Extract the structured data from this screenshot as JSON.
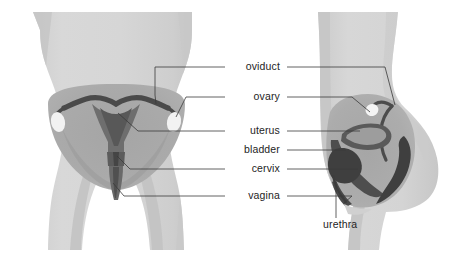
{
  "diagram": {
    "views": [
      {
        "id": "frontal",
        "name": "frontal view",
        "side": "left"
      },
      {
        "id": "sagittal",
        "name": "sagittal side view",
        "side": "right"
      }
    ],
    "background_color": "#ffffff"
  },
  "palette": {
    "body": "#d4d4d4",
    "body_edge": "#c4c4c4",
    "body_shadow": "#c8c8c8",
    "pelvis": "#a9a9a9",
    "pelvis_deep": "#9a9a9a",
    "organ_dark": "#4b4b4b",
    "organ_mid": "#6f6f6f",
    "ovary_white": "#f3f3f3",
    "leader_line": "#3a3a3a",
    "label_text": "#242424"
  },
  "labels": [
    {
      "id": "oviduct",
      "text": "oviduct",
      "x": 280,
      "y": 70,
      "align": "end"
    },
    {
      "id": "ovary",
      "text": "ovary",
      "x": 280,
      "y": 100,
      "align": "end"
    },
    {
      "id": "uterus",
      "text": "uterus",
      "x": 280,
      "y": 134,
      "align": "end"
    },
    {
      "id": "bladder",
      "text": "bladder",
      "x": 280,
      "y": 153,
      "align": "end"
    },
    {
      "id": "cervix",
      "text": "cervix",
      "x": 280,
      "y": 172,
      "align": "end"
    },
    {
      "id": "vagina",
      "text": "vagina",
      "x": 280,
      "y": 199,
      "align": "end"
    },
    {
      "id": "urethra",
      "text": "urethra",
      "x": 323,
      "y": 228,
      "align": "start"
    }
  ]
}
